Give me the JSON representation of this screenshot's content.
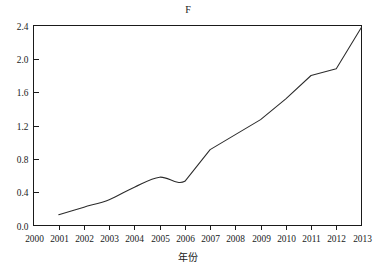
{
  "chart_data": {
    "type": "line",
    "title": "F",
    "xlabel": "年份",
    "ylabel": "",
    "x": [
      2001,
      2002,
      2003,
      2004,
      2005,
      2006,
      2007,
      2008,
      2009,
      2010,
      2011,
      2012,
      2013
    ],
    "values": [
      0.13,
      0.22,
      0.31,
      0.46,
      0.58,
      0.53,
      0.91,
      1.09,
      1.27,
      1.52,
      1.8,
      1.88,
      2.38
    ],
    "series": [
      {
        "name": "F",
        "values": [
          0.13,
          0.22,
          0.31,
          0.46,
          0.58,
          0.53,
          0.91,
          1.09,
          1.27,
          1.52,
          1.8,
          1.88,
          2.38
        ]
      }
    ],
    "x_tick_labels": [
      "2000",
      "2001",
      "2002",
      "2003",
      "2004",
      "2005",
      "2006",
      "2007",
      "2008",
      "2009",
      "2010",
      "2011",
      "2012",
      "2013"
    ],
    "y_tick_labels": [
      "0.0",
      "0.4",
      "0.8",
      "1.2",
      "1.6",
      "2.0",
      "2.4"
    ],
    "y_ticks": [
      0.0,
      0.4,
      0.8,
      1.2,
      1.6,
      2.0,
      2.4
    ],
    "xlim": [
      2000,
      2013
    ],
    "ylim": [
      0.0,
      2.4
    ],
    "grid": false,
    "legend": "none",
    "line_color": "#2b2b2b",
    "axis_color": "#1a1a1a",
    "background": "#ffffff"
  }
}
